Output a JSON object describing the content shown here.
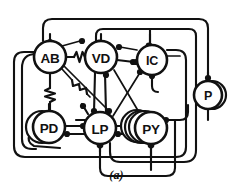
{
  "figure": {
    "caption": "(a)",
    "background_color": "#ffffff",
    "line_color": "#111111",
    "title": ""
  },
  "nodes": [
    {
      "id": "AB",
      "label": "AB",
      "cx": 50,
      "cy": 57,
      "r": 16,
      "multiplicity": 1,
      "ghost_offsets": []
    },
    {
      "id": "VD",
      "label": "VD",
      "cx": 101,
      "cy": 57,
      "r": 16,
      "multiplicity": 1,
      "ghost_offsets": []
    },
    {
      "id": "IC",
      "label": "IC",
      "cx": 152,
      "cy": 60,
      "r": 15,
      "multiplicity": 1,
      "ghost_offsets": []
    },
    {
      "id": "P",
      "label": "P",
      "cx": 208,
      "cy": 95,
      "r": 14,
      "multiplicity": 2,
      "ghost_offsets": [
        4
      ]
    },
    {
      "id": "PD",
      "label": "PD",
      "cx": 49,
      "cy": 127,
      "r": 16,
      "multiplicity": 2,
      "ghost_offsets": [
        -5
      ]
    },
    {
      "id": "LP",
      "label": "LP",
      "cx": 100,
      "cy": 128,
      "r": 16,
      "multiplicity": 1,
      "ghost_offsets": []
    },
    {
      "id": "PY",
      "label": "PY",
      "cx": 151,
      "cy": 128,
      "r": 16,
      "multiplicity": 4,
      "ghost_offsets": [
        -6,
        -10,
        -14
      ]
    }
  ],
  "synapse_symbols": {
    "inhibitory": "filled-circle",
    "electrical": "resistor-zigzag"
  },
  "gap_junctions": [
    {
      "from": "AB",
      "to": "VD",
      "symbol": "resistor-zigzag"
    },
    {
      "from": "AB",
      "to": "PD",
      "symbol": "resistor-zigzag"
    },
    {
      "from": "AB",
      "to": "LP",
      "symbol": "resistor-zigzag"
    }
  ],
  "chemical_synapses": [
    {
      "from": "AB",
      "to": "VD"
    },
    {
      "from": "VD",
      "to": "IC"
    },
    {
      "from": "IC",
      "to": "VD"
    },
    {
      "from": "VD",
      "to": "LP"
    },
    {
      "from": "LP",
      "to": "VD"
    },
    {
      "from": "PD",
      "to": "LP"
    },
    {
      "from": "LP",
      "to": "PD"
    },
    {
      "from": "LP",
      "to": "PY"
    },
    {
      "from": "PY",
      "to": "LP"
    },
    {
      "from": "IC",
      "to": "LP"
    },
    {
      "from": "AB",
      "to": "LP"
    },
    {
      "from": "AB",
      "to": "PY"
    },
    {
      "from": "VD",
      "to": "PY"
    },
    {
      "from": "PY",
      "to": "IC"
    },
    {
      "from": "P",
      "to": "AB"
    },
    {
      "from": "P",
      "to": "VD"
    },
    {
      "from": "P",
      "to": "IC"
    },
    {
      "from": "PY",
      "to": "P"
    },
    {
      "from": "LP",
      "to": "P"
    }
  ]
}
